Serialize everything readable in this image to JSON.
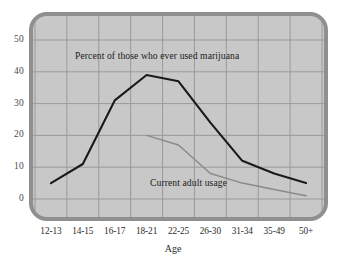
{
  "chart_data": {
    "type": "line",
    "title": "",
    "xlabel": "Age",
    "ylabel": "",
    "categories": [
      "12-13",
      "14-15",
      "16-17",
      "18-21",
      "22-25",
      "26-30",
      "31-34",
      "35-49",
      "50+"
    ],
    "ylim": [
      0,
      50
    ],
    "yticks": [
      0,
      10,
      20,
      30,
      40,
      50
    ],
    "grid": true,
    "legend_position": "inline-annotation",
    "series": [
      {
        "name": "Percent of those who ever used marijuana",
        "color": "#1a1a1a",
        "values": [
          5,
          11,
          31,
          39,
          37,
          24,
          12,
          8,
          5
        ]
      },
      {
        "name": "Current adult usage",
        "color": "#8a8a8a",
        "values": [
          null,
          null,
          null,
          20,
          17,
          8,
          5,
          3,
          1
        ]
      }
    ],
    "annotations": [
      {
        "text": "Percent of those who ever used marijuana",
        "series": "upper"
      },
      {
        "text": "Current adult usage",
        "series": "lower"
      }
    ]
  },
  "axes": {
    "y_tick_labels": [
      "50",
      "40",
      "30",
      "20",
      "10",
      "0"
    ],
    "x_tick_labels": [
      "12-13",
      "14-15",
      "16-17",
      "18-21",
      "22-25",
      "26-30",
      "31-34",
      "35-49",
      "50+"
    ],
    "x_axis_title": "Age"
  },
  "style": {
    "plot_background": "#c8c8c8",
    "frame_color": "#8f8f8f",
    "grid_color": "#9a9a9a",
    "upper_series_color": "#1a1a1a",
    "lower_series_color": "#8a8a8a",
    "page_background": "#ffffff"
  }
}
